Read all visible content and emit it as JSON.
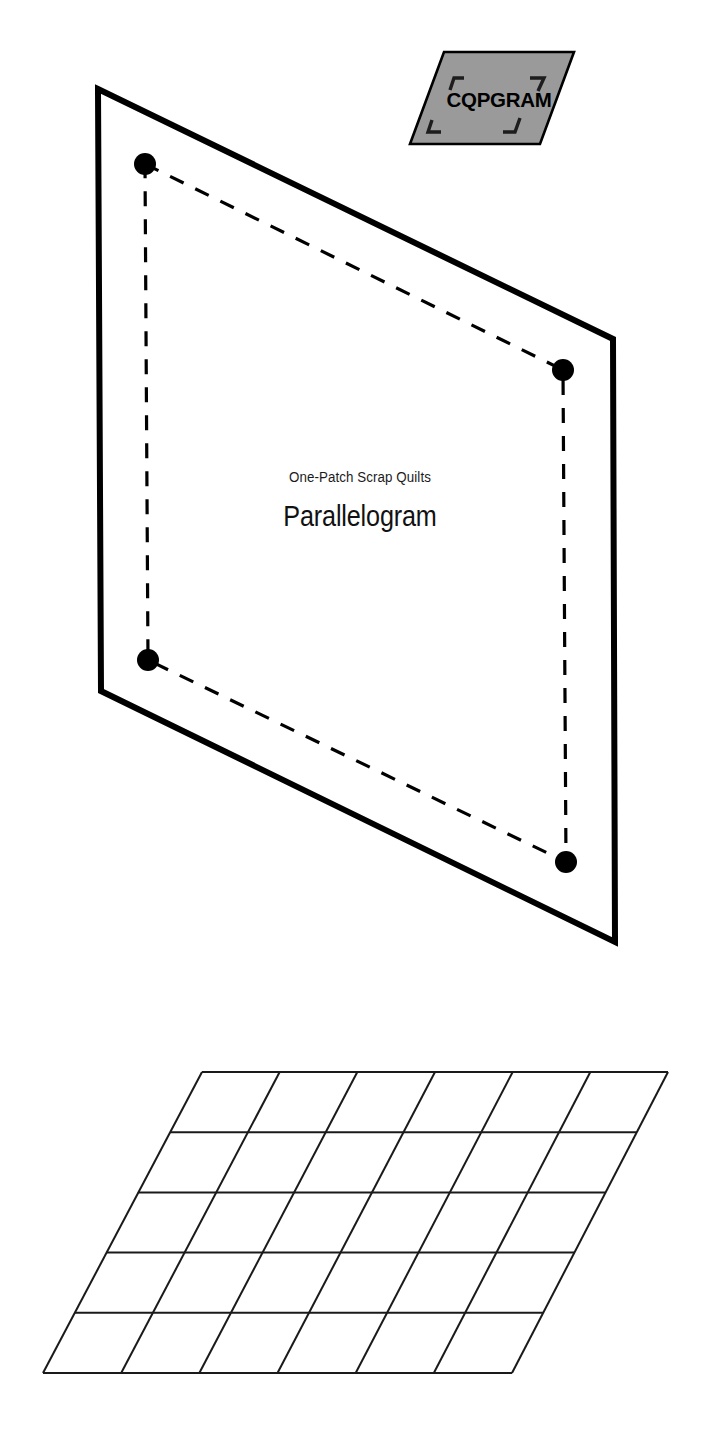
{
  "page": {
    "background_color": "#ffffff",
    "width": 707,
    "height": 1450
  },
  "brand": {
    "label": "CQPGRAM",
    "shape": "parallelogram",
    "fill_color": "#9a9a9a",
    "stroke_color": "#000000",
    "text_color": "#000000",
    "corner_marks": 4
  },
  "title": {
    "supertitle": "One-Patch Scrap Quilts",
    "main": "Parallelogram",
    "text_color": "#111111"
  },
  "template": {
    "name": "parallelogram-patch-template",
    "outline_color": "#000000",
    "outline_width_px": 6,
    "seam_line_style": "dashed",
    "seam_line_color": "#000000",
    "marker_shape": "dot",
    "marker_color": "#000000",
    "marker_count": 4,
    "outline_points": "98,89 613,339 615,942 101,691",
    "seam_points": "145,164 563,370 566,862 148,660",
    "markers": [
      {
        "name": "corner-dot-top-left",
        "cx": 145,
        "cy": 164,
        "r": 11
      },
      {
        "name": "corner-dot-top-right",
        "cx": 563,
        "cy": 370,
        "r": 11
      },
      {
        "name": "corner-dot-bottom-right",
        "cx": 566,
        "cy": 862,
        "r": 11
      },
      {
        "name": "corner-dot-bottom-left",
        "cx": 148,
        "cy": 660,
        "r": 11
      }
    ]
  },
  "grid_diagram": {
    "name": "parallelogram-tiling-grid",
    "columns": 6,
    "rows": 5,
    "line_color": "#1a1a1a",
    "line_width_px": 2,
    "top_left": "202,1072",
    "top_right": "668,1072",
    "bottom_right": "512,1373",
    "bottom_left": "43,1373"
  }
}
